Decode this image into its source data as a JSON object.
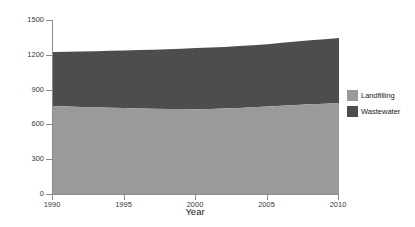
{
  "chart_data": {
    "type": "area",
    "title": "",
    "subtitle": "",
    "xlabel": "Year",
    "ylabel_text": "Emissions (Mt CO2 eq)",
    "ylabel_prefix": "Emissions (Mt CO",
    "ylabel_sub": "2",
    "ylabel_suffix": " eq)",
    "stacked": true,
    "grid": false,
    "legend_position": "right",
    "xlim": [
      1990,
      2010
    ],
    "ylim": [
      0,
      1500
    ],
    "xticks": [
      1990,
      1995,
      2000,
      2005,
      2010
    ],
    "xtick_labels": [
      "1990",
      "1995",
      "2000",
      "2005",
      "2010"
    ],
    "yticks": [
      0,
      300,
      600,
      900,
      1200,
      1500
    ],
    "ytick_labels": [
      "0",
      "300",
      "600",
      "900",
      "1200",
      "1500"
    ],
    "x": [
      1990,
      1991,
      1992,
      1993,
      1994,
      1995,
      1996,
      1997,
      1998,
      1999,
      2000,
      2001,
      2002,
      2003,
      2004,
      2005,
      2006,
      2007,
      2008,
      2009,
      2010
    ],
    "series": [
      {
        "name": "Landfilling",
        "color": "#9a9a9a",
        "values": [
          758,
          754,
          750,
          747,
          744,
          742,
          738,
          735,
          733,
          732,
          731,
          733,
          737,
          742,
          748,
          755,
          761,
          767,
          773,
          779,
          785
        ]
      },
      {
        "name": "Wastewater",
        "color": "#4d4d4d",
        "values": [
          466,
          472,
          478,
          484,
          490,
          496,
          503,
          509,
          515,
          521,
          527,
          529,
          531,
          533,
          535,
          537,
          542,
          548,
          552,
          556,
          560
        ]
      }
    ],
    "totals": [
      1224,
      1226,
      1228,
      1231,
      1234,
      1238,
      1241,
      1244,
      1248,
      1253,
      1258,
      1262,
      1268,
      1275,
      1283,
      1292,
      1303,
      1315,
      1325,
      1335,
      1345
    ],
    "legend": [
      {
        "label": "Landfilling",
        "color": "#9a9a9a"
      },
      {
        "label": "Wastewater",
        "color": "#4d4d4d"
      }
    ],
    "axis_color": "#8c8c8c",
    "text_color": "#1a1a1a",
    "tick_text_color": "#3a3a3a",
    "background": "#ffffff"
  }
}
